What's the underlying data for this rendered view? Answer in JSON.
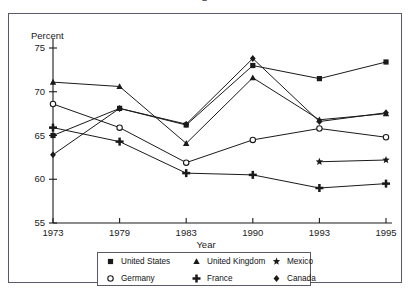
{
  "cropped_title": "p",
  "chart_data": {
    "type": "line",
    "title": "",
    "xlabel": "Year",
    "ylabel": "Percent",
    "categories": [
      "1973",
      "1979",
      "1983",
      "1990",
      "1993",
      "1995"
    ],
    "ylim": [
      55,
      75
    ],
    "yticks": [
      55,
      60,
      65,
      70,
      75
    ],
    "ytick_labels": [
      "55",
      "60",
      "65",
      "70",
      "75"
    ],
    "grid": false,
    "legend_position": "bottom",
    "series": [
      {
        "name": "United States",
        "marker": "filled-square",
        "x": [
          "1973",
          "1979",
          "1983",
          "1990",
          "1993",
          "1995"
        ],
        "values": [
          65.0,
          68.1,
          66.2,
          73.0,
          71.5,
          73.4
        ]
      },
      {
        "name": "Germany",
        "marker": "open-circle",
        "x": [
          "1973",
          "1979",
          "1983",
          "1990",
          "1993",
          "1995"
        ],
        "values": [
          68.6,
          65.9,
          61.9,
          64.5,
          65.8,
          64.8
        ]
      },
      {
        "name": "United Kingdom",
        "marker": "filled-triangle",
        "x": [
          "1973",
          "1979",
          "1983",
          "1990",
          "1993",
          "1995"
        ],
        "values": [
          71.1,
          70.6,
          64.1,
          71.6,
          66.8,
          67.5
        ]
      },
      {
        "name": "France",
        "marker": "bold-plus",
        "x": [
          "1973",
          "1979",
          "1983",
          "1990",
          "1993",
          "1995"
        ],
        "values": [
          65.9,
          64.3,
          60.7,
          60.5,
          59.0,
          59.5
        ]
      },
      {
        "name": "Mexico",
        "marker": "filled-star",
        "x": [
          "1993",
          "1995"
        ],
        "values": [
          62.0,
          62.2
        ]
      },
      {
        "name": "Canada",
        "marker": "filled-diamond",
        "x": [
          "1973",
          "1979",
          "1983",
          "1990",
          "1993",
          "1995"
        ],
        "values": [
          62.8,
          68.1,
          66.3,
          73.8,
          66.6,
          67.6
        ]
      }
    ]
  },
  "legend": {
    "entries": [
      {
        "label": "United States",
        "marker": "filled-square"
      },
      {
        "label": "United Kingdom",
        "marker": "filled-triangle"
      },
      {
        "label": "Mexico",
        "marker": "filled-star"
      },
      {
        "label": "Germany",
        "marker": "open-circle"
      },
      {
        "label": "France",
        "marker": "bold-plus"
      },
      {
        "label": "Canada",
        "marker": "filled-diamond"
      }
    ]
  },
  "colors": {
    "line": "#1a1a1a",
    "frame": "#5a5a66",
    "text": "#1a1a1a",
    "background": "#ffffff"
  }
}
